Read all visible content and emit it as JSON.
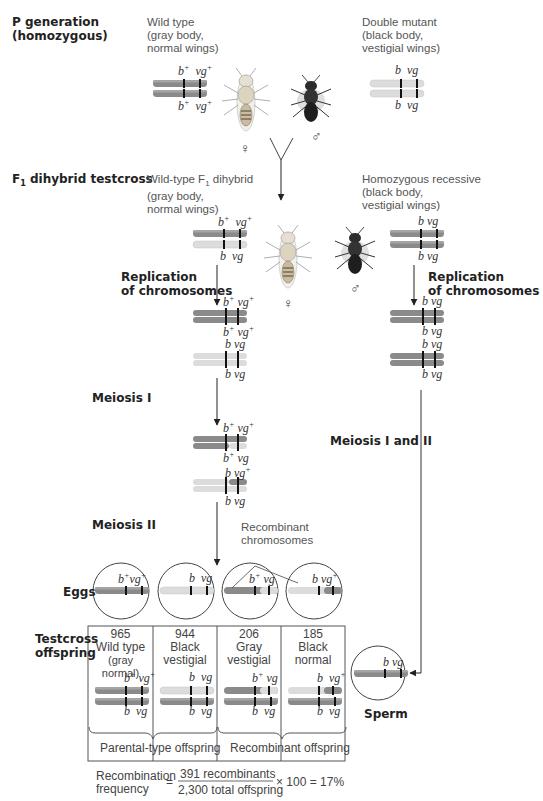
{
  "colors": {
    "wild_chromosome": "#8a8a8a",
    "mutant_chromosome": "#dcdcdc",
    "gene_band": "#111111",
    "arrow": "#222222",
    "text": "#222222"
  },
  "p_generation": {
    "label": "P generation",
    "sublabel": "(homozygous)",
    "wild": {
      "line1": "Wild type",
      "line2": "(gray body,",
      "line3": "normal wings)",
      "sex": "♀"
    },
    "mutant": {
      "line1": "Double mutant",
      "line2": "(black body,",
      "line3": "vestigial wings)",
      "sex": "♂"
    }
  },
  "f1": {
    "label": "F",
    "label_sub": "1",
    "label_rest": " dihybrid testcross",
    "female": {
      "line1a": "Wild-type F",
      "line1sub": "1",
      "line1b": " dihybrid",
      "line2": "(gray body,",
      "line3": "normal wings)",
      "sex": "♀"
    },
    "male": {
      "line1": "Homozygous recessive",
      "line2": "(black body,",
      "line3": "vestigial wings)",
      "sex": "♂"
    }
  },
  "steps": {
    "replication": {
      "line1": "Replication",
      "line2": "of chromosomes"
    },
    "meiosis1": "Meiosis I",
    "meiosis12": "Meiosis I and II",
    "meiosis2": "Meiosis II",
    "recombinant_label": {
      "line1": "Recombinant",
      "line2": "chromosomes"
    },
    "eggs": "Eggs",
    "sperm": "Sperm",
    "testcross": {
      "line1": "Testcross",
      "line2": "offspring"
    }
  },
  "alleles": {
    "b": "b",
    "vg": "vg",
    "plus": "+"
  },
  "offspring": [
    {
      "count": "965",
      "line1": "Wild type",
      "line2": "(gray normal)",
      "top": [
        "b+",
        "vg+"
      ],
      "bottom": [
        "b",
        "vg"
      ],
      "egg": [
        "b+",
        "vg+"
      ]
    },
    {
      "count": "944",
      "line1": "Black",
      "line2": "vestigial",
      "top": [
        "b",
        "vg"
      ],
      "bottom": [
        "b",
        "vg"
      ],
      "egg": [
        "b",
        "vg"
      ]
    },
    {
      "count": "206",
      "line1": "Gray",
      "line2": "vestigial",
      "top": [
        "b+",
        "vg"
      ],
      "bottom": [
        "b",
        "vg"
      ],
      "egg": [
        "b+",
        "vg"
      ]
    },
    {
      "count": "185",
      "line1": "Black",
      "line2": "normal",
      "top": [
        "b",
        "vg+"
      ],
      "bottom": [
        "b",
        "vg"
      ],
      "egg": [
        "b",
        "vg+"
      ]
    }
  ],
  "groups": {
    "parental": "Parental-type offspring",
    "recombinant": "Recombinant offspring"
  },
  "formula": {
    "lhs1": "Recombination",
    "lhs2": "frequency",
    "eq": "=",
    "numerator": "391 recombinants",
    "denominator": "2,300 total offspring",
    "rhs": "× 100 = 17%"
  }
}
